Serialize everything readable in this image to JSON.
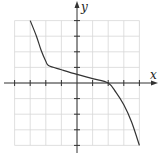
{
  "chart_data": {
    "type": "line",
    "title": "",
    "xlabel": "x",
    "ylabel": "y",
    "xlim": [
      -4,
      4
    ],
    "ylim": [
      -4,
      4
    ],
    "grid": true,
    "tick_step": 1,
    "tick_labels_shown": false,
    "series": [
      {
        "name": "f(x)",
        "color": "#333333",
        "points": [
          [
            -3,
            4
          ],
          [
            -2.6,
            3.0
          ],
          [
            -2.3,
            2.1
          ],
          [
            -2.0,
            1.4
          ],
          [
            -1.8,
            1.1
          ],
          [
            -1.0,
            0.85
          ],
          [
            0,
            0.55
          ],
          [
            1.0,
            0.28
          ],
          [
            2,
            0
          ],
          [
            2.5,
            -0.6
          ],
          [
            3.0,
            -1.4
          ],
          [
            3.5,
            -2.5
          ],
          [
            4,
            -4
          ]
        ]
      }
    ]
  },
  "labels": {
    "x_axis": "x",
    "y_axis": "y"
  },
  "colors": {
    "grid": "#d8d8d8",
    "axis": "#333333",
    "curve": "#333333"
  }
}
